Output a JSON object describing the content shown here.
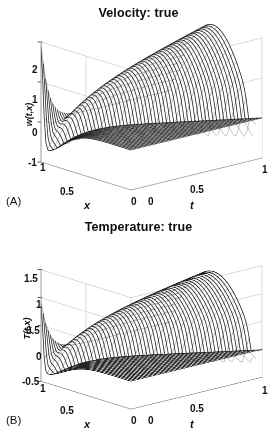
{
  "figure": {
    "background": "#ffffff",
    "mesh_color": "#1b1b1b",
    "grid_color": "#d2d2d2",
    "axis_color": "#9a9a9a",
    "text_color": "#111111"
  },
  "panels": [
    {
      "id": "A",
      "letter": "(A)",
      "title": "Velocity: true",
      "ylabel": "w(t,x)",
      "xlabel": "x",
      "tlabel": "t",
      "x_ticks": [
        "1",
        "0.5",
        "0"
      ],
      "t_ticks": [
        "0",
        "0.5",
        "1"
      ],
      "z_ticks": [
        "2",
        "1",
        "0",
        "-1"
      ]
    },
    {
      "id": "B",
      "letter": "(B)",
      "title": "Temperature: true",
      "ylabel": "T(t,x)",
      "xlabel": "x",
      "tlabel": "t",
      "x_ticks": [
        "1",
        "0.5",
        "0"
      ],
      "t_ticks": [
        "0",
        "0.5",
        "1"
      ],
      "z_ticks": [
        "1.5",
        "1",
        "0.5",
        "0",
        "-0.5"
      ]
    }
  ],
  "chart_data": [
    {
      "type": "surface",
      "panel": "A",
      "title": "Velocity: true",
      "xlabel": "x",
      "ylabel": "t",
      "zlabel": "w(t,x)",
      "xlim": [
        0,
        1
      ],
      "tlim": [
        0,
        1
      ],
      "zlim": [
        -1,
        2
      ],
      "x_ticks": [
        1,
        0.5,
        0
      ],
      "t_ticks": [
        0,
        0.5,
        1
      ],
      "z_ticks": [
        2,
        1,
        0,
        -1
      ],
      "grid": true,
      "legend": "none",
      "mesh_style": "wireframe-dense-lines",
      "nx": 56,
      "nt": 56,
      "surface_model": {
        "description": "Traveling wave: narrow high spike at x=1,t=0 decaying with t; negative trough region at small t; broad smooth hump rising to ~2 at large t and x near 0.6; drops to ~-0.6 at t edge band.",
        "spike_amplitude": 2.0,
        "spike_x": 1.0,
        "trough_min": -0.7,
        "hump_peak": 2.0,
        "hump_center_x": 0.62,
        "hump_center_t": 0.78,
        "edge_value": -0.55
      },
      "annotations": [
        "(A)"
      ]
    },
    {
      "type": "surface",
      "panel": "B",
      "title": "Temperature: true",
      "xlabel": "x",
      "ylabel": "t",
      "zlabel": "T(t,x)",
      "xlim": [
        0,
        1
      ],
      "tlim": [
        0,
        1
      ],
      "zlim": [
        -0.5,
        1.5
      ],
      "x_ticks": [
        1,
        0.5,
        0
      ],
      "t_ticks": [
        0,
        0.5,
        1
      ],
      "z_ticks": [
        1.5,
        1,
        0.5,
        0,
        -0.5
      ],
      "grid": true,
      "legend": "none",
      "mesh_style": "wireframe-dense-lines",
      "nx": 56,
      "nt": 56,
      "surface_model": {
        "description": "Smoother companion field: narrow spike near x=1,t=0 of height ~0.9, shallow negative trough ~-0.35, broad rounded hump peaking ~1.15 near x=0.6,t=0.72, tapering to 0 at far corners.",
        "spike_amplitude": 0.95,
        "spike_x": 1.0,
        "trough_min": -0.35,
        "hump_peak": 1.15,
        "hump_center_x": 0.6,
        "hump_center_t": 0.72,
        "edge_value": -0.3
      },
      "annotations": [
        "(B)"
      ]
    }
  ],
  "layout": {
    "panel_a": {
      "title_top": 6,
      "z_tick_positions": [
        [
          32,
          65
        ],
        [
          32,
          95
        ],
        [
          32,
          128
        ],
        [
          28,
          158
        ]
      ],
      "x_tick_positions": [
        [
          40,
          163
        ],
        [
          60,
          187
        ],
        [
          131,
          197
        ]
      ],
      "t_tick_positions": [
        [
          148,
          197
        ],
        [
          190,
          185
        ],
        [
          262,
          165
        ]
      ],
      "xlabel_pos": [
        84,
        200
      ],
      "tlabel_pos": [
        190,
        200
      ],
      "ylabel_pos": [
        18,
        110
      ],
      "letter_pos": [
        6,
        196
      ]
    },
    "panel_b": {
      "title_top": 6,
      "z_tick_positions": [
        [
          24,
          60
        ],
        [
          36,
          86
        ],
        [
          26,
          112
        ],
        [
          36,
          138
        ],
        [
          22,
          163
        ]
      ],
      "x_tick_positions": [
        [
          40,
          170
        ],
        [
          60,
          192
        ],
        [
          131,
          202
        ]
      ],
      "t_tick_positions": [
        [
          148,
          202
        ],
        [
          190,
          190
        ],
        [
          262,
          172
        ]
      ],
      "xlabel_pos": [
        84,
        205
      ],
      "tlabel_pos": [
        190,
        205
      ],
      "ylabel_pos": [
        16,
        110
      ],
      "letter_pos": [
        6,
        201
      ]
    }
  }
}
